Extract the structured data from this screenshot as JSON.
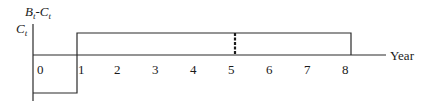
{
  "diagram": {
    "type": "cash-flow-diagram",
    "y_axis_label": {
      "line1": {
        "main": "B",
        "sub": "t",
        "sep": "-",
        "main2": "C",
        "sub2": "t"
      },
      "line2": {
        "main": "C",
        "sub": "t"
      }
    },
    "x_axis_label": "Year",
    "ticks": [
      "0",
      "1",
      "2",
      "3",
      "4",
      "5",
      "6",
      "7",
      "8"
    ],
    "bars": [
      {
        "name": "year-0-cost",
        "from": 0,
        "to": 1,
        "direction": "negative"
      },
      {
        "name": "years-1-8-net-benefit",
        "from": 1,
        "to": 8,
        "direction": "positive"
      }
    ],
    "marker": {
      "at_year": 5,
      "style": "thick-dashed"
    },
    "colors": {
      "line": "#2a2a2a",
      "background": "#ffffff"
    }
  }
}
